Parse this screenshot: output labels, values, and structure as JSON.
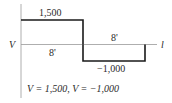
{
  "diagram": {
    "type": "shear-diagram",
    "axis": {
      "vertical_label": "V",
      "horizontal_label": "l"
    },
    "segments": [
      {
        "value": 1500,
        "value_label": "1,500",
        "length_label": "8'"
      },
      {
        "value": -1000,
        "value_label": "−1,000",
        "length_label": "8'"
      }
    ],
    "caption": "V = 1,500,  V = −1,000",
    "colors": {
      "line": "#1a1a1a",
      "axis": "#888888"
    }
  }
}
